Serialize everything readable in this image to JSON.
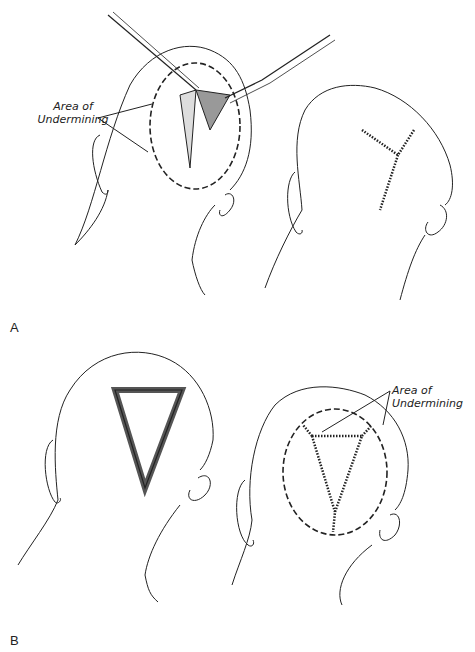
{
  "figure": {
    "panels": [
      {
        "id": "A",
        "label": "A",
        "annotation": {
          "line1": "Area of",
          "line2": "Undermining"
        },
        "views": [
          {
            "name": "undermining-with-instruments",
            "instruments": [
              "skin-hook",
              "scalpel"
            ],
            "defect": "triangular-flap",
            "undermining_area": "dashed-ellipse"
          },
          {
            "name": "y-closure-result",
            "closure": "Y-shaped suture line"
          }
        ]
      },
      {
        "id": "B",
        "label": "B",
        "annotation": {
          "line1": "Area of",
          "line2": "Undermining"
        },
        "views": [
          {
            "name": "triangular-defect",
            "defect": "triangular-excision"
          },
          {
            "name": "triangular-closure-result",
            "closure": "triangular suture line",
            "undermining_area": "dashed-ellipse"
          }
        ]
      }
    ],
    "colors": {
      "line": "#222222",
      "background": "#ffffff"
    }
  }
}
